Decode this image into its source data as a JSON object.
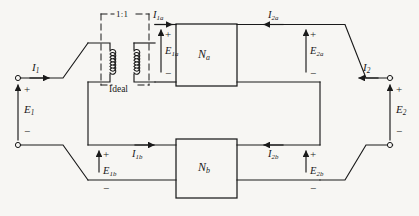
{
  "figure": {
    "type": "circuit-diagram",
    "background_color": "#f7f6f3",
    "line_color": "#1a1a1a"
  },
  "transformer": {
    "ratio_label": "1:1",
    "name_label": "Ideal",
    "box_style": "dashed"
  },
  "networks": [
    {
      "id": "na",
      "label": "N",
      "subscript": "a"
    },
    {
      "id": "nb",
      "label": "N",
      "subscript": "b"
    }
  ],
  "terminals": {
    "left": {
      "current": {
        "label": "I",
        "subscript": "1"
      },
      "voltage": {
        "label": "E",
        "subscript": "1"
      },
      "plus": "+",
      "minus": "−"
    },
    "right": {
      "current": {
        "label": "I",
        "subscript": "2"
      },
      "voltage": {
        "label": "E",
        "subscript": "2"
      },
      "plus": "+",
      "minus": "−"
    }
  },
  "port_labels": [
    {
      "id": "i1a",
      "label": "I",
      "subscript": "1a"
    },
    {
      "id": "e1a",
      "label": "E",
      "subscript": "1a",
      "plus": "+",
      "minus": "−"
    },
    {
      "id": "i2a",
      "label": "I",
      "subscript": "2a"
    },
    {
      "id": "e2a",
      "label": "E",
      "subscript": "2a",
      "plus": "+",
      "minus": "−"
    },
    {
      "id": "i1b",
      "label": "I",
      "subscript": "1b"
    },
    {
      "id": "e1b",
      "label": "E",
      "subscript": "1b",
      "plus": "+",
      "minus": "−"
    },
    {
      "id": "i2b",
      "label": "I",
      "subscript": "2b"
    },
    {
      "id": "e2b",
      "label": "E",
      "subscript": "2b",
      "plus": "+",
      "minus": "−"
    }
  ]
}
